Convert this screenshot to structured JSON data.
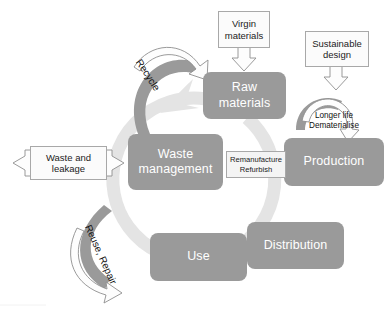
{
  "diagram": {
    "colors": {
      "node_fill": "#9a9a9a",
      "node_text": "#ffffff",
      "input_box_fill": "#fbfbfb",
      "input_box_border": "#a8a8a8",
      "arrow_fill": "#9a9a9a",
      "arrow_outline_fill": "#fdfdfd",
      "arrow_outline_stroke": "#8f8f8f",
      "background_cycle": "#e2e2e2",
      "page_background": "#ffffff"
    },
    "nodes": [
      {
        "id": "raw-materials",
        "label": "Raw\nmaterials"
      },
      {
        "id": "production",
        "label": "Production"
      },
      {
        "id": "distribution",
        "label": "Distribution"
      },
      {
        "id": "use",
        "label": "Use"
      },
      {
        "id": "waste-management",
        "label": "Waste\nmanagement"
      }
    ],
    "input_boxes": [
      {
        "id": "virgin-materials",
        "label": "Virgin\nmaterials"
      },
      {
        "id": "sustainable-design",
        "label": "Sustainable\ndesign"
      },
      {
        "id": "waste-and-leakage",
        "label": "Waste and\nleakage"
      },
      {
        "id": "remanufacture-refurbish",
        "label": "Remanufacture\nRefurbish"
      }
    ],
    "flow_labels": [
      {
        "id": "recycle",
        "label": "Recycle"
      },
      {
        "id": "reuse-repair",
        "label": "Reuse, Repair"
      },
      {
        "id": "longer-life-dematerialise",
        "label": "Longer life\nDematerialise"
      }
    ]
  }
}
